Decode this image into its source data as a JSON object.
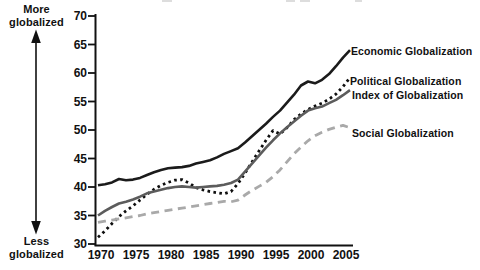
{
  "annotations": {
    "more_globalized": "More\nglobalized",
    "less_globalized": "Less\nglobalized"
  },
  "colors": {
    "axis": "#111111",
    "text": "#111111",
    "background": "#ffffff",
    "economic": "#1b1b1b",
    "political": "#0f0f0f",
    "index": "#5c5c5c",
    "social": "#a9a9a9",
    "artifact": "#cfcfcf"
  },
  "chart_data": {
    "type": "line",
    "title": "",
    "xlabel": "",
    "ylabel": "",
    "grid": false,
    "legend_position": "right-of-line-ends",
    "xlim": [
      1970,
      2006
    ],
    "ylim": [
      30,
      70
    ],
    "x_ticks": [
      1970,
      1975,
      1980,
      1985,
      1990,
      1995,
      2000,
      2005
    ],
    "y_ticks": [
      30,
      35,
      40,
      45,
      50,
      55,
      60,
      65,
      70
    ],
    "y_axis_direction_top": "More globalized",
    "y_axis_direction_bottom": "Less globalized",
    "x": [
      1970,
      1971,
      1972,
      1973,
      1974,
      1975,
      1976,
      1977,
      1978,
      1979,
      1980,
      1981,
      1982,
      1983,
      1984,
      1985,
      1986,
      1987,
      1988,
      1989,
      1990,
      1991,
      1992,
      1993,
      1994,
      1995,
      1996,
      1997,
      1998,
      1999,
      2000,
      2001,
      2002,
      2003,
      2004,
      2005,
      2006
    ],
    "series": [
      {
        "id": "economic",
        "name": "Economic Globalization",
        "color": "#1b1b1b",
        "style": "solid",
        "width": 2.6,
        "values": [
          40.3,
          40.5,
          40.8,
          41.4,
          41.2,
          41.3,
          41.6,
          42.1,
          42.6,
          43.0,
          43.3,
          43.4,
          43.5,
          43.7,
          44.1,
          44.4,
          44.7,
          45.2,
          45.8,
          46.3,
          46.8,
          47.8,
          48.9,
          50.0,
          51.1,
          52.3,
          53.4,
          54.8,
          56.2,
          57.8,
          58.5,
          58.2,
          58.8,
          59.8,
          61.2,
          62.7,
          64.0
        ]
      },
      {
        "id": "political",
        "name": "Political Globalization",
        "color": "#0f0f0f",
        "style": "dotted",
        "width": 2.8,
        "values": [
          31.2,
          32.3,
          33.6,
          34.8,
          35.8,
          36.7,
          37.7,
          38.7,
          39.6,
          40.3,
          40.8,
          41.2,
          41.3,
          40.7,
          39.9,
          39.5,
          39.2,
          39.0,
          38.8,
          39.2,
          40.6,
          42.4,
          44.4,
          46.3,
          48.2,
          49.9,
          49.3,
          50.4,
          51.8,
          52.8,
          53.6,
          54.2,
          54.7,
          55.4,
          56.3,
          57.6,
          59.2
        ]
      },
      {
        "id": "index",
        "name": "Index of Globalization",
        "color": "#5c5c5c",
        "style": "solid",
        "width": 2.6,
        "values": [
          35.0,
          35.8,
          36.5,
          37.1,
          37.4,
          37.8,
          38.3,
          38.9,
          39.2,
          39.5,
          39.8,
          40.0,
          40.1,
          40.0,
          39.9,
          40.0,
          40.1,
          40.2,
          40.4,
          40.7,
          41.3,
          42.7,
          44.1,
          45.5,
          46.9,
          48.2,
          49.4,
          50.5,
          51.5,
          52.5,
          53.4,
          53.8,
          54.1,
          54.7,
          55.3,
          56.1,
          57.0
        ]
      },
      {
        "id": "social",
        "name": "Social Globalization",
        "color": "#a9a9a9",
        "style": "dashed",
        "width": 2.8,
        "values": [
          33.8,
          34.0,
          34.2,
          34.4,
          34.6,
          34.8,
          35.0,
          35.3,
          35.5,
          35.7,
          35.9,
          36.1,
          36.3,
          36.5,
          36.7,
          36.9,
          37.1,
          37.3,
          37.5,
          37.4,
          37.7,
          38.6,
          39.4,
          40.1,
          40.8,
          41.8,
          43.0,
          44.4,
          45.8,
          47.0,
          48.1,
          49.0,
          49.6,
          50.1,
          50.5,
          50.8,
          50.4
        ]
      }
    ]
  }
}
